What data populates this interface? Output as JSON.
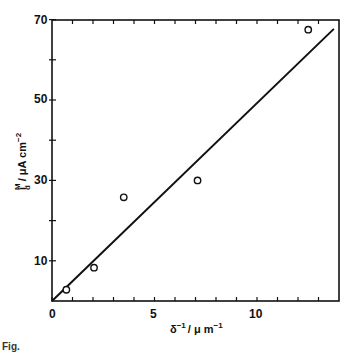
{
  "chart_data": {
    "type": "scatter",
    "title": "",
    "xlabel": "δ⁻¹ / μm⁻¹",
    "ylabel": "i_d^M / μA cm⁻²",
    "xlim": [
      0,
      14.1
    ],
    "ylim": [
      0,
      70
    ],
    "x_ticks_labeled": [
      0,
      5,
      10
    ],
    "x_minor_ticks": [
      1,
      2,
      3,
      4,
      6,
      7,
      8,
      9,
      11,
      12,
      13
    ],
    "y_ticks_labeled": [
      10,
      30,
      50,
      70
    ],
    "y_minor_ticks": [
      20,
      40,
      60
    ],
    "grid": false,
    "legend": null,
    "series": [
      {
        "name": "measured",
        "marker": "open-circle",
        "x": [
          0.7,
          2.05,
          3.5,
          7.1,
          12.5
        ],
        "y": [
          2.8,
          8.3,
          25.8,
          30.0,
          67.5
        ]
      },
      {
        "name": "fit-line",
        "type": "line",
        "x": [
          0,
          13.75
        ],
        "y": [
          0,
          67.7
        ]
      }
    ]
  },
  "labels": {
    "x_tick_0": "0",
    "x_tick_5": "5",
    "x_tick_10": "10",
    "y_tick_10": "10",
    "y_tick_30": "30",
    "y_tick_50": "50",
    "y_tick_70": "70",
    "xlabel_main": "δ",
    "xlabel_sup": "−1",
    "xlabel_unit": "/ μ m",
    "xlabel_unit_sup": "−1",
    "ylabel_i": "i",
    "ylabel_sub": "d",
    "ylabel_sup": "M",
    "ylabel_unit": "/ μA cm",
    "ylabel_unit_sup": "−2"
  },
  "caption": "Fig."
}
